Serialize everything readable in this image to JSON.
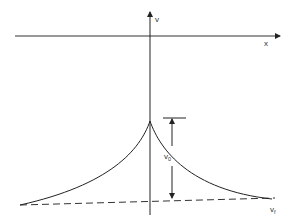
{
  "diagram": {
    "axes": {
      "x_label": "x",
      "v_label": "v"
    },
    "annotations": {
      "v0_label": "v",
      "v0_subscript": "0",
      "vf_label": "v",
      "vf_subscript": "f"
    },
    "colors": {
      "line": "#222222",
      "background": "#ffffff"
    }
  }
}
